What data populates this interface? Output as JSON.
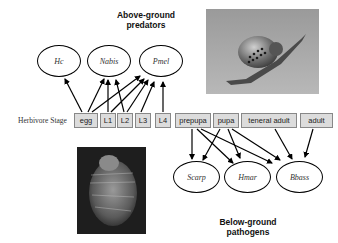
{
  "titles": {
    "above": "Above-ground\npredators",
    "above_line1": "Above-ground",
    "above_line2": "predators",
    "below_line1": "Below-ground",
    "below_line2": "pathogens"
  },
  "predators": [
    {
      "label": "Hc"
    },
    {
      "label": "Nabis"
    },
    {
      "label": "Pmel"
    }
  ],
  "herbivore_stage_label": "Herbivore Stage",
  "stages": [
    {
      "label": "egg"
    },
    {
      "label": "L1"
    },
    {
      "label": "L2"
    },
    {
      "label": "L3"
    },
    {
      "label": "L4"
    },
    {
      "label": "prepupa"
    },
    {
      "label": "pupa"
    },
    {
      "label": "teneral adult"
    },
    {
      "label": "adult"
    }
  ],
  "pathogens": [
    {
      "label": "Scarp"
    },
    {
      "label": "Hmar"
    },
    {
      "label": "Bbass"
    }
  ],
  "photos": {
    "top": "beetle-larva-photo",
    "bottom": "pupa-photo"
  }
}
